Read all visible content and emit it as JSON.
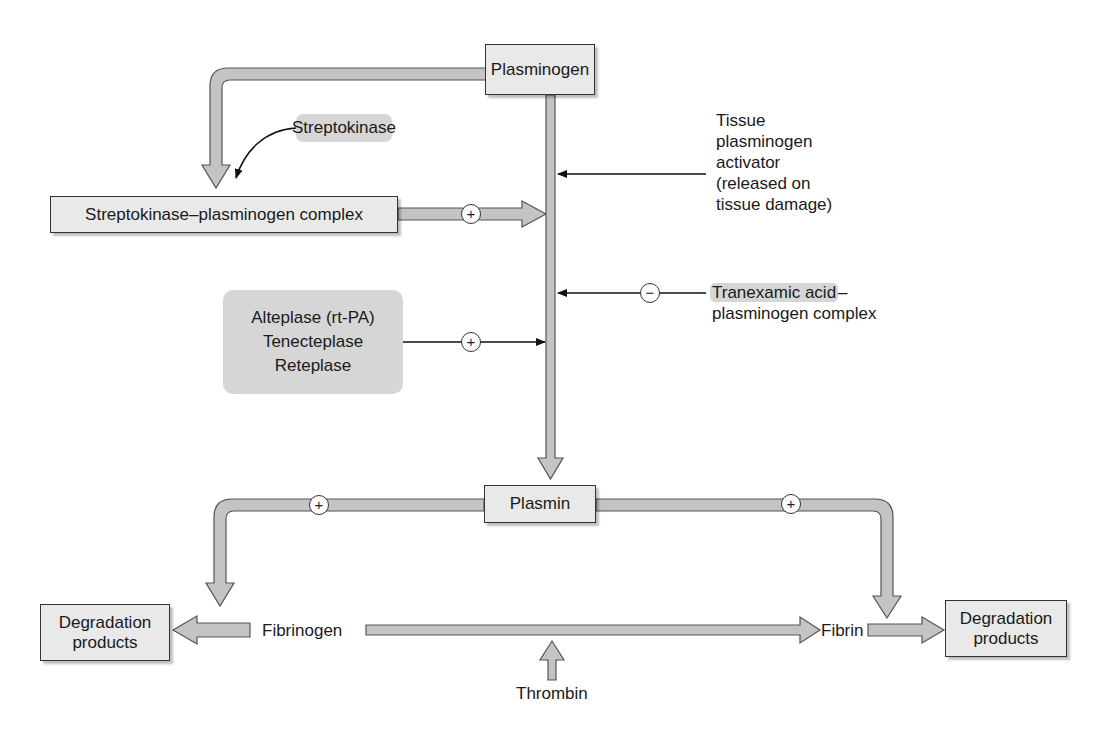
{
  "diagram": {
    "nodes": {
      "plasminogen": "Plasminogen",
      "streptokinase": "Streptokinase",
      "sk_complex": "Streptokinase–plasminogen complex",
      "tpa_line1": "Tissue",
      "tpa_line2": "plasminogen",
      "tpa_line3": "activator",
      "tpa_line4": "(released on",
      "tpa_line5": "tissue damage)",
      "tranexamic_line1": "Tranexamic acid",
      "tranexamic_dash": "–",
      "tranexamic_line2": "plasminogen complex",
      "drugs_line1": "Alteplase (rt-PA)",
      "drugs_line2": "Tenecteplase",
      "drugs_line3": "Reteplase",
      "plasmin": "Plasmin",
      "fibrinogen": "Fibrinogen",
      "fibrin": "Fibrin",
      "thrombin": "Thrombin",
      "degradation_left": "Degradation products",
      "degradation_right": "Degradation products"
    },
    "signs": {
      "sk_complex_effect": "+",
      "drugs_effect": "+",
      "tranexamic_effect": "−",
      "plasmin_fibrinogen_effect": "+",
      "plasmin_fibrin_effect": "+"
    },
    "edges": [
      {
        "from": "Plasminogen",
        "to": "Streptokinase–plasminogen complex",
        "type": "conversion"
      },
      {
        "from": "Streptokinase",
        "to": "Streptokinase–plasminogen complex",
        "type": "binding"
      },
      {
        "from": "Streptokinase–plasminogen complex",
        "to": "Plasminogen→Plasmin",
        "sign": "+"
      },
      {
        "from": "Tissue plasminogen activator",
        "to": "Plasminogen→Plasmin",
        "sign": "+"
      },
      {
        "from": "Tranexamic acid–plasminogen complex",
        "to": "Plasminogen→Plasmin",
        "sign": "−"
      },
      {
        "from": "Alteplase/Tenecteplase/Reteplase",
        "to": "Plasminogen→Plasmin",
        "sign": "+"
      },
      {
        "from": "Plasminogen",
        "to": "Plasmin",
        "type": "conversion"
      },
      {
        "from": "Plasmin",
        "to": "Fibrinogen→Degradation products",
        "sign": "+"
      },
      {
        "from": "Plasmin",
        "to": "Fibrin→Degradation products",
        "sign": "+"
      },
      {
        "from": "Fibrinogen",
        "to": "Fibrin",
        "type": "conversion"
      },
      {
        "from": "Thrombin",
        "to": "Fibrinogen→Fibrin",
        "type": "catalysis"
      }
    ],
    "colors": {
      "pipe_fill": "#c4c4c4",
      "pipe_stroke": "#555555",
      "box_fill": "#e9e9e9",
      "highlight_fill": "#d6d6d6",
      "line": "#111111"
    }
  }
}
